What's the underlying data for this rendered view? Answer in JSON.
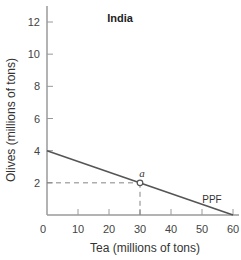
{
  "chart_data": {
    "type": "line",
    "title": "India",
    "xlabel": "Tea (millions of tons)",
    "ylabel": "Olives (millions of tons)",
    "xlim": [
      0,
      60
    ],
    "ylim": [
      0,
      13
    ],
    "x_ticks": [
      0,
      10,
      20,
      30,
      40,
      50,
      60
    ],
    "y_ticks": [
      2,
      4,
      6,
      8,
      10,
      12
    ],
    "grid": false,
    "series": [
      {
        "name": "PPF",
        "x": [
          0,
          60
        ],
        "y": [
          4,
          0
        ]
      }
    ],
    "points": [
      {
        "label": "a",
        "x": 30,
        "y": 2
      }
    ],
    "annotations": [
      "PPF",
      "a"
    ],
    "colors": {
      "axis": "#9a9a9a",
      "line": "#555555",
      "dashed": "#777777"
    }
  }
}
